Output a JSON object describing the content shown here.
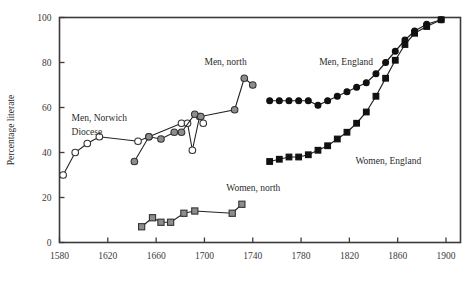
{
  "chart_data": {
    "type": "line",
    "title": "",
    "xlabel": "",
    "ylabel": "Percentage literate",
    "xlim": [
      1580,
      1912
    ],
    "ylim": [
      0,
      100
    ],
    "xticks": [
      1580,
      1620,
      1660,
      1700,
      1740,
      1780,
      1820,
      1860,
      1900
    ],
    "yticks": [
      0,
      20,
      40,
      60,
      80,
      100
    ],
    "grid": false,
    "legend": "inline annotations",
    "series": [
      {
        "name": "Men, Norwich Diocese",
        "marker": "open-circle",
        "label_text": "Men, Norwich",
        "label_text2": "Diocese",
        "points": [
          {
            "x": 1583,
            "y": 30
          },
          {
            "x": 1593,
            "y": 40
          },
          {
            "x": 1603,
            "y": 44
          },
          {
            "x": 1613,
            "y": 47
          },
          {
            "x": 1645,
            "y": 45
          },
          {
            "x": 1654,
            "y": 47
          },
          {
            "x": 1681,
            "y": 53
          },
          {
            "x": 1686,
            "y": 53
          },
          {
            "x": 1690,
            "y": 41
          },
          {
            "x": 1696,
            "y": 56
          },
          {
            "x": 1699,
            "y": 53
          }
        ]
      },
      {
        "name": "Men, north",
        "marker": "grey-circle",
        "label_text": "Men, north",
        "points": [
          {
            "x": 1642,
            "y": 36
          },
          {
            "x": 1654,
            "y": 47
          },
          {
            "x": 1664,
            "y": 46
          },
          {
            "x": 1675,
            "y": 49
          },
          {
            "x": 1681,
            "y": 49
          },
          {
            "x": 1692,
            "y": 57
          },
          {
            "x": 1697,
            "y": 56
          },
          {
            "x": 1725,
            "y": 59
          },
          {
            "x": 1733,
            "y": 73
          },
          {
            "x": 1740,
            "y": 70
          }
        ]
      },
      {
        "name": "Women, north",
        "marker": "grey-square",
        "label_text": "Women, north",
        "points": [
          {
            "x": 1648,
            "y": 7
          },
          {
            "x": 1657,
            "y": 11
          },
          {
            "x": 1664,
            "y": 9
          },
          {
            "x": 1672,
            "y": 9
          },
          {
            "x": 1683,
            "y": 13
          },
          {
            "x": 1692,
            "y": 14
          },
          {
            "x": 1723,
            "y": 13
          },
          {
            "x": 1731,
            "y": 17
          }
        ]
      },
      {
        "name": "Men, England",
        "marker": "black-circle",
        "label_text": "Men, England",
        "points": [
          {
            "x": 1754,
            "y": 63
          },
          {
            "x": 1762,
            "y": 63
          },
          {
            "x": 1770,
            "y": 63
          },
          {
            "x": 1778,
            "y": 63
          },
          {
            "x": 1786,
            "y": 63
          },
          {
            "x": 1794,
            "y": 61
          },
          {
            "x": 1802,
            "y": 63
          },
          {
            "x": 1810,
            "y": 65
          },
          {
            "x": 1818,
            "y": 67
          },
          {
            "x": 1826,
            "y": 69
          },
          {
            "x": 1834,
            "y": 71
          },
          {
            "x": 1842,
            "y": 75
          },
          {
            "x": 1850,
            "y": 80
          },
          {
            "x": 1858,
            "y": 85
          },
          {
            "x": 1866,
            "y": 90
          },
          {
            "x": 1874,
            "y": 94
          },
          {
            "x": 1884,
            "y": 97
          },
          {
            "x": 1896,
            "y": 99
          }
        ]
      },
      {
        "name": "Women, England",
        "marker": "black-square",
        "label_text": "Women, England",
        "points": [
          {
            "x": 1754,
            "y": 36
          },
          {
            "x": 1762,
            "y": 37
          },
          {
            "x": 1770,
            "y": 38
          },
          {
            "x": 1778,
            "y": 38
          },
          {
            "x": 1786,
            "y": 39
          },
          {
            "x": 1794,
            "y": 41
          },
          {
            "x": 1802,
            "y": 43
          },
          {
            "x": 1810,
            "y": 46
          },
          {
            "x": 1818,
            "y": 49
          },
          {
            "x": 1826,
            "y": 53
          },
          {
            "x": 1834,
            "y": 58
          },
          {
            "x": 1842,
            "y": 65
          },
          {
            "x": 1850,
            "y": 73
          },
          {
            "x": 1858,
            "y": 81
          },
          {
            "x": 1866,
            "y": 88
          },
          {
            "x": 1874,
            "y": 93
          },
          {
            "x": 1884,
            "y": 96
          },
          {
            "x": 1896,
            "y": 99
          }
        ]
      }
    ],
    "annotations": [
      {
        "id": "men-norwich",
        "text": "Men, Norwich",
        "x": 1590,
        "y": 54
      },
      {
        "id": "men-norwich2",
        "text": "Diocese",
        "x": 1590,
        "y": 48
      },
      {
        "id": "men-north",
        "text": "Men, north",
        "x": 1700,
        "y": 79
      },
      {
        "id": "men-england",
        "text": "Men, England",
        "x": 1795,
        "y": 79
      },
      {
        "id": "women-north",
        "text": "Women, north",
        "x": 1718,
        "y": 23
      },
      {
        "id": "women-england",
        "text": "Women, England",
        "x": 1825,
        "y": 35
      }
    ]
  }
}
